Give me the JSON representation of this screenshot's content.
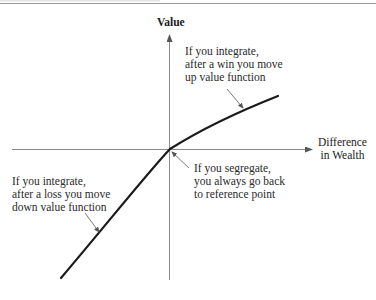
{
  "diagram": {
    "title_fragment": "",
    "axes": {
      "y_label": "Value",
      "x_label": [
        "Difference",
        "in Wealth"
      ]
    },
    "annotations": {
      "win": [
        "If you integrate,",
        "after a win you move",
        "up value function"
      ],
      "segregate": [
        "If you segregate,",
        "you always go back",
        "to reference point"
      ],
      "loss": [
        "If you integrate,",
        "after a loss you move",
        "down value function"
      ]
    },
    "colors": {
      "axis": "#8a8a8a",
      "curve": "#1a1a1a",
      "pointer": "#6a6a6a",
      "text": "#2a2a2a"
    }
  }
}
